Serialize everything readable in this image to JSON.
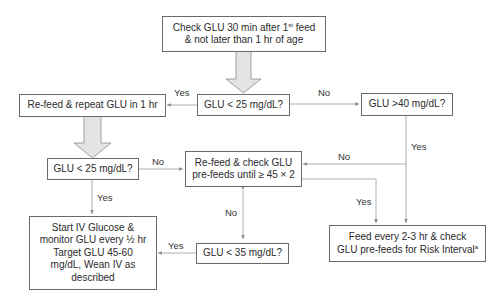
{
  "flowchart": {
    "nodes": {
      "start": {
        "line1_pre": "Check GLU 30 min after 1",
        "line1_sup": "st",
        "line1_post": " feed",
        "line2": "& not later than 1 hr of age"
      },
      "glu_lt25_first": {
        "text": "GLU < 25 mg/dL?"
      },
      "refeed_repeat": {
        "text": "Re-feed & repeat GLU in 1 hr"
      },
      "glu_gt40": {
        "text": "GLU >40 mg/dL?"
      },
      "glu_lt25_second": {
        "text": "GLU < 25 mg/dL?"
      },
      "refeed_check": {
        "line1": "Re-feed & check GLU",
        "line2": "pre-feeds until ≥ 45 × 2"
      },
      "start_iv": {
        "line1": "Start IV Glucose &",
        "line2": "monitor GLU every ½ hr",
        "line3": "Target GLU 45-60",
        "line4": "mg/dL, Wean IV as",
        "line5": "described"
      },
      "glu_lt35": {
        "text": "GLU < 35 mg/dL?"
      },
      "feed_every": {
        "line1": "Feed every 2-3 hr & check",
        "line2_pre": "GLU pre-feeds for Risk Interval",
        "line2_sup": "a"
      }
    },
    "edge_labels": {
      "first_yes": "Yes",
      "first_no": "No",
      "gt40_yes": "Yes",
      "gt40_no": "No",
      "second_no": "No",
      "second_yes": "Yes",
      "refeed_check_yes": "Yes",
      "lt35_no": "No",
      "lt35_yes": "Yes"
    },
    "colors": {
      "border": "#6a6a6a",
      "line": "#9a9a9a",
      "big_arrow_fill": "#e4e4e4",
      "big_arrow_stroke": "#8a8a8a"
    }
  }
}
